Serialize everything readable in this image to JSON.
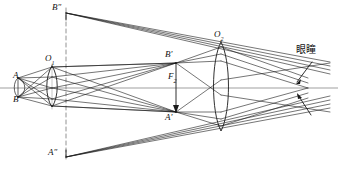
{
  "figure": {
    "width": 338,
    "height": 173,
    "background_color": "#ffffff",
    "line_color": "#1a1a1a",
    "axis_color": "#555555",
    "dashed_color": "#666666"
  },
  "labels": {
    "object_top": "A",
    "object_bottom": "B",
    "objective_center": "O",
    "objective_sub": "1",
    "eyepiece_center": "O",
    "eyepiece_sub": "2",
    "image_top_prime": "B'",
    "image_bottom_prime": "A'",
    "virtual_top": "B″",
    "virtual_bottom": "A″",
    "focal_point": "F",
    "focal_sub": "2",
    "eye_pupil": "眼瞳"
  },
  "geometry": {
    "axis_y": 88,
    "objective": {
      "cx": 52,
      "top_y": 66,
      "bottom_y": 107,
      "bulge": 7
    },
    "eyepiece": {
      "cx": 221,
      "top_y": 42,
      "bottom_y": 131,
      "bulge": 9
    },
    "object": {
      "a_y": 78,
      "b_y": 97,
      "x": 18
    },
    "intermediate_image": {
      "x": 176,
      "b_prime_y": 63,
      "a_prime_y": 112
    },
    "virtual_image": {
      "x": 66,
      "b_dprime_y": 13,
      "a_dprime_y": 157
    },
    "pupil": {
      "x": 300,
      "y": 88
    },
    "dashed_line_x": 66
  },
  "elements": {
    "objective_lens": "biconvex-lens",
    "eyepiece_lens": "biconvex-lens",
    "optical_axis": "horizontal-axis-line",
    "pupil_arrows": 2,
    "focal_arrow": "downward-arrow"
  }
}
